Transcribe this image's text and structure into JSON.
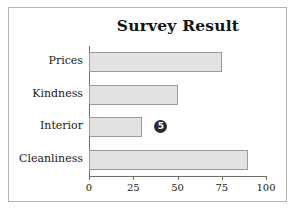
{
  "figure": {
    "background_color": "#ffffff",
    "frame_color": "#b4b4b4"
  },
  "chart_data": {
    "type": "bar",
    "orientation": "horizontal",
    "title": "Survey Result",
    "xlabel": "",
    "ylabel": "",
    "categories": [
      "Prices",
      "Kindness",
      "Interior",
      "Cleanliness"
    ],
    "values": [
      75,
      50,
      30,
      90
    ],
    "xlim": [
      0,
      100
    ],
    "xticks": [
      "0",
      "25",
      "50",
      "75",
      "100"
    ],
    "xtick_values": [
      0,
      25,
      50,
      75,
      100
    ],
    "grid": false,
    "legend": false,
    "bar_color": "#e2e2e2",
    "bar_edge_color": "#9a9a9a",
    "axis_color": "#6e6e6e",
    "annotations": [
      {
        "name": "circled-number-5",
        "text": "5",
        "shape": "filled-circle",
        "color": "#2b2b2b",
        "text_color": "#ffffff",
        "near_category": "Interior",
        "x_value": 37
      }
    ]
  }
}
